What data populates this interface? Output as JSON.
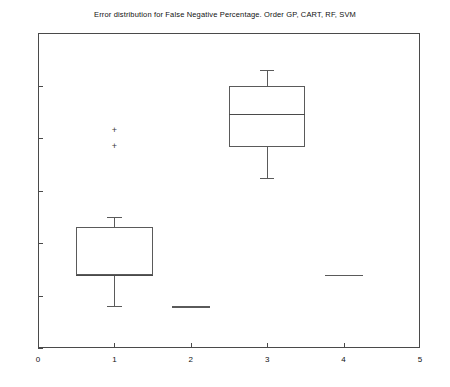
{
  "chart_data": {
    "type": "box",
    "title": "Error distribution for False Negative Percentage. Order GP, CART, RF, SVM",
    "xlabel": "",
    "ylabel": "",
    "xlim": [
      0,
      5
    ],
    "ylim": [
      10,
      70
    ],
    "xticks": [
      "0",
      "1",
      "2",
      "3",
      "4",
      "5"
    ],
    "yticks": [
      "10",
      "20",
      "30",
      "40",
      "50",
      "60",
      "70"
    ],
    "grid": false,
    "legend": "none",
    "categories": [
      "GP",
      "CART",
      "RF",
      "SVM"
    ],
    "boxes": [
      {
        "name": "GP",
        "x": 1,
        "whisker_low": 18,
        "q1": 24,
        "median": 24,
        "q3": 33,
        "whisker_high": 35,
        "outliers": [
          51.5,
          48.5
        ]
      },
      {
        "name": "CART",
        "x": 2,
        "whisker_low": 18,
        "q1": 18,
        "median": 18,
        "q3": 18,
        "whisker_high": 18,
        "outliers": []
      },
      {
        "name": "RF",
        "x": 3,
        "whisker_low": 42.3,
        "q1": 48.3,
        "median": 54.5,
        "q3": 60,
        "whisker_high": 63,
        "outliers": []
      },
      {
        "name": "SVM",
        "x": 4,
        "whisker_low": 24,
        "q1": 24,
        "median": 24,
        "q3": 24,
        "whisker_high": 24,
        "outliers": []
      }
    ],
    "outlier_marker": "+",
    "colors": {
      "axis": "#4a4a4a",
      "box": "#5a5a5a",
      "median": "#4a4a4a",
      "outlier": "#3a3a3a",
      "background": "#ffffff"
    }
  }
}
